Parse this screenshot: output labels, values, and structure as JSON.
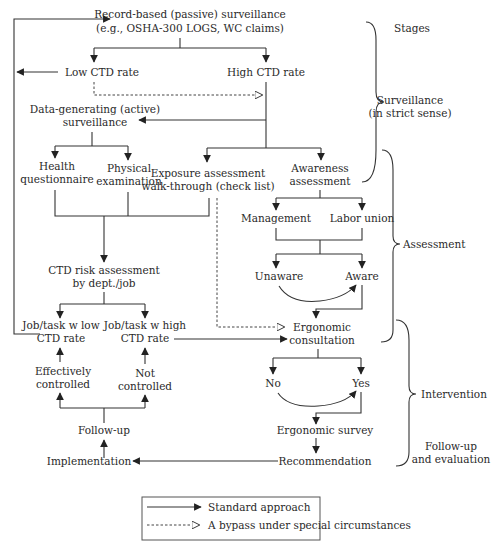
{
  "diagram": {
    "nodes": {
      "record_based": {
        "lines": [
          "Record-based (passive) surveillance",
          "(e.g., OSHA-300 LOGS, WC claims)"
        ]
      },
      "low_ctd": {
        "lines": [
          "Low CTD rate"
        ]
      },
      "high_ctd": {
        "lines": [
          "High CTD rate"
        ]
      },
      "data_generating": {
        "lines": [
          "Data-generating (active)",
          "surveillance"
        ]
      },
      "health_q": {
        "lines": [
          "Health",
          "questionnaire"
        ]
      },
      "physical_exam": {
        "lines": [
          "Physical",
          "examination"
        ]
      },
      "exposure": {
        "lines": [
          "Exposure assessment",
          "walk-through (check list)"
        ]
      },
      "awareness": {
        "lines": [
          "Awareness",
          "assessment"
        ]
      },
      "management": {
        "lines": [
          "Management"
        ]
      },
      "labor_union": {
        "lines": [
          "Labor union"
        ]
      },
      "unaware": {
        "lines": [
          "Unaware"
        ]
      },
      "aware": {
        "lines": [
          "Aware"
        ]
      },
      "ctd_risk": {
        "lines": [
          "CTD risk assessment",
          "by dept./job"
        ]
      },
      "job_low": {
        "lines": [
          "Job/task w low",
          "CTD rate"
        ]
      },
      "job_high": {
        "lines": [
          "Job/task w high",
          "CTD rate"
        ]
      },
      "ergo_consult": {
        "lines": [
          "Ergonomic",
          "consultation"
        ]
      },
      "effectively": {
        "lines": [
          "Effectively",
          "controlled"
        ]
      },
      "not_controlled": {
        "lines": [
          "Not",
          "controlled"
        ]
      },
      "no": {
        "lines": [
          "No"
        ]
      },
      "yes": {
        "lines": [
          "Yes"
        ]
      },
      "follow_up": {
        "lines": [
          "Follow-up"
        ]
      },
      "ergo_survey": {
        "lines": [
          "Ergonomic survey"
        ]
      },
      "implementation": {
        "lines": [
          "Implementation"
        ]
      },
      "recommendation": {
        "lines": [
          "Recommendation"
        ]
      }
    },
    "stages": {
      "header": "Stages",
      "surveillance": [
        "Surveillance",
        "(in strict sense)"
      ],
      "assessment": [
        "Assessment"
      ],
      "intervention": [
        "Intervention"
      ],
      "followup_eval": [
        "Follow-up",
        "and evaluation"
      ]
    },
    "legend": {
      "standard": "Standard approach",
      "bypass": "A bypass under special circumstances"
    }
  }
}
